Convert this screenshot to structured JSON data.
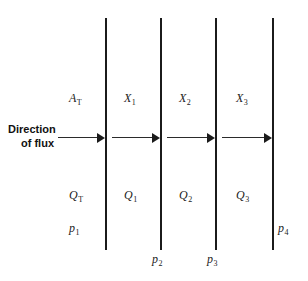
{
  "diagram": {
    "background_color": "#ffffff",
    "line_color": "#1b1b1b",
    "flux_caption": {
      "line1": "Direction",
      "line2": "of flux"
    },
    "walls": [
      {
        "id": "wall-1",
        "x": 105,
        "top": 18,
        "bottom": 250
      },
      {
        "id": "wall-2",
        "x": 160,
        "top": 18,
        "bottom": 250
      },
      {
        "id": "wall-3",
        "x": 215,
        "top": 18,
        "bottom": 250
      },
      {
        "id": "wall-4",
        "x": 272,
        "top": 18,
        "bottom": 250
      }
    ],
    "arrows": [
      {
        "id": "arrow-1",
        "x": 58,
        "y": 133,
        "width": 47
      },
      {
        "id": "arrow-2",
        "x": 112,
        "y": 133,
        "width": 48
      },
      {
        "id": "arrow-3",
        "x": 167,
        "y": 133,
        "width": 48
      },
      {
        "id": "arrow-4",
        "x": 222,
        "y": 133,
        "width": 50
      }
    ],
    "area_label": {
      "symbol": "A",
      "subscript": "T"
    },
    "thickness_labels": [
      {
        "symbol": "X",
        "subscript": "1"
      },
      {
        "symbol": "X",
        "subscript": "2"
      },
      {
        "symbol": "X",
        "subscript": "3"
      }
    ],
    "flow_labels": [
      {
        "symbol": "Q",
        "subscript": "T"
      },
      {
        "symbol": "Q",
        "subscript": "1"
      },
      {
        "symbol": "Q",
        "subscript": "2"
      },
      {
        "symbol": "Q",
        "subscript": "3"
      }
    ],
    "pressure_labels": [
      {
        "symbol": "p",
        "subscript": "1"
      },
      {
        "symbol": "p",
        "subscript": "2"
      },
      {
        "symbol": "p",
        "subscript": "3"
      },
      {
        "symbol": "p",
        "subscript": "4"
      }
    ]
  }
}
